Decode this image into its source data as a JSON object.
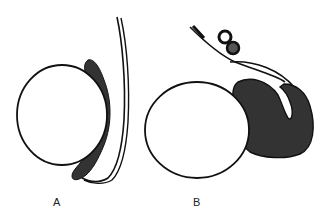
{
  "figure": {
    "panels": [
      {
        "id": "A",
        "label": "A"
      },
      {
        "id": "B",
        "label": "B"
      }
    ],
    "colors": {
      "outline": "#111111",
      "fill_dark": "#333333",
      "background": "#ffffff"
    }
  }
}
